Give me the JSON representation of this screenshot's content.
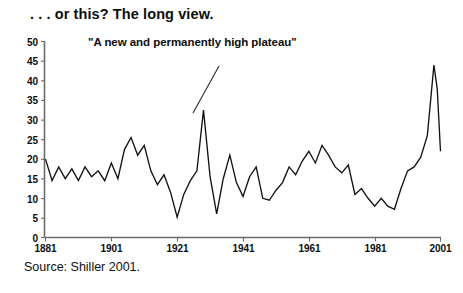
{
  "title": ". . . or this? The long view.",
  "source_note": "Source: Shiller 2001.",
  "annotation_text": "\"A new and permanently high plateau\"",
  "colors": {
    "line": "#121212",
    "axis": "#6b6b6b",
    "text": "#0d0d0d",
    "background": "#ffffff"
  },
  "chart_data": {
    "type": "line",
    "title": ". . . or this? The long view.",
    "xlabel": "",
    "ylabel": "",
    "xlim": [
      1881,
      2001
    ],
    "ylim": [
      0,
      50
    ],
    "grid": false,
    "legend": null,
    "xticks": [
      1881,
      1901,
      1921,
      1941,
      1961,
      1981,
      2001
    ],
    "yticks": [
      0,
      5,
      10,
      15,
      20,
      25,
      30,
      35,
      40,
      45,
      50
    ],
    "annotations": [
      {
        "text": "\"A new and permanently high plateau\"",
        "points_to_x": 1929,
        "points_to_y": 32.5
      }
    ],
    "series": [
      {
        "name": "Price-earnings ratio",
        "x": [
          1881,
          1883,
          1885,
          1887,
          1889,
          1891,
          1893,
          1895,
          1897,
          1899,
          1901,
          1903,
          1905,
          1907,
          1909,
          1911,
          1913,
          1915,
          1917,
          1919,
          1921,
          1923,
          1925,
          1927,
          1929,
          1931,
          1933,
          1935,
          1937,
          1939,
          1941,
          1943,
          1945,
          1947,
          1949,
          1951,
          1953,
          1955,
          1957,
          1959,
          1961,
          1963,
          1965,
          1967,
          1969,
          1971,
          1973,
          1975,
          1977,
          1979,
          1981,
          1983,
          1985,
          1987,
          1989,
          1991,
          1993,
          1995,
          1997,
          1999,
          2000,
          2001
        ],
        "values": [
          20.0,
          14.5,
          18.0,
          15.0,
          17.5,
          14.5,
          18.0,
          15.5,
          17.0,
          14.5,
          19.0,
          15.0,
          22.5,
          25.5,
          21.0,
          23.5,
          17.0,
          13.5,
          16.0,
          11.5,
          5.2,
          11.0,
          14.5,
          17.0,
          32.5,
          15.5,
          6.0,
          15.0,
          21.0,
          14.0,
          10.5,
          15.5,
          18.0,
          10.0,
          9.5,
          12.0,
          14.0,
          18.0,
          16.0,
          19.5,
          22.0,
          19.0,
          23.5,
          21.0,
          18.0,
          16.5,
          18.5,
          11.0,
          12.5,
          10.0,
          8.0,
          10.0,
          8.0,
          7.2,
          12.5,
          17.0,
          18.0,
          20.5,
          26.0,
          44.0,
          38.0,
          22.0
        ]
      }
    ]
  },
  "axes": {
    "y_tick_labels": [
      "50",
      "45",
      "40",
      "35",
      "30",
      "25",
      "20",
      "15",
      "10",
      "5",
      "0"
    ],
    "x_tick_labels": [
      "1881",
      "1901",
      "1921",
      "1941",
      "1961",
      "1981",
      "2001"
    ]
  }
}
